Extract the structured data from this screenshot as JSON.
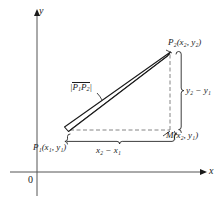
{
  "figure": {
    "axes": {
      "y_label": "y",
      "x_label": "x",
      "origin_label": "0"
    },
    "points": {
      "p1": "P₁(x₁, y₁)",
      "p2": "P₂(x₂, y₂)",
      "m": "M(x₂, y₁)"
    },
    "segments": {
      "hypotenuse": "|P₁P₂|",
      "horizontal_leg": "x₂ − x₁",
      "vertical_leg": "y₂ − y₁"
    },
    "colors": {
      "ink": "#1a1a1a",
      "axis": "#555555",
      "dashed": "#777777",
      "background": "#ffffff"
    }
  }
}
